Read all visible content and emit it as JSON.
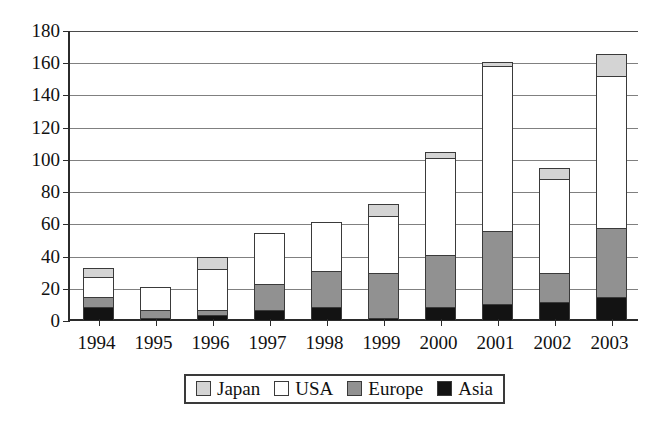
{
  "chart_data": {
    "type": "bar",
    "stacked": true,
    "title": "",
    "subtitle": "",
    "xlabel": "",
    "ylabel": "",
    "categories": [
      "1994",
      "1995",
      "1996",
      "1997",
      "1998",
      "1999",
      "2000",
      "2001",
      "2002",
      "2003"
    ],
    "series": [
      {
        "name": "Asia",
        "color": "#131313",
        "values": [
          8,
          1,
          3,
          6,
          8,
          1,
          8,
          10,
          11,
          14
        ]
      },
      {
        "name": "Europe",
        "color": "#919191",
        "values": [
          7,
          6,
          4,
          17,
          23,
          29,
          33,
          46,
          19,
          44
        ]
      },
      {
        "name": "USA",
        "color": "#ffffff",
        "values": [
          13,
          15,
          26,
          32,
          31,
          36,
          61,
          103,
          59,
          95
        ]
      },
      {
        "name": "Japan",
        "color": "#d4d4d4",
        "values": [
          6,
          0,
          8,
          0,
          0,
          8,
          4,
          3,
          7,
          14
        ]
      }
    ],
    "totals": [
      34,
      22,
      41,
      55,
      62,
      74,
      106,
      162,
      96,
      167
    ],
    "ylim": [
      0,
      180
    ],
    "yticks": [
      0,
      20,
      40,
      60,
      80,
      100,
      120,
      140,
      160,
      180
    ],
    "ytick_labels": [
      "0",
      "20",
      "40",
      "60",
      "80",
      "100",
      "120",
      "140",
      "160",
      "180"
    ],
    "grid": true,
    "legend_position": "bottom"
  },
  "legend": {
    "items": [
      {
        "label": "Japan",
        "swatch": "legend-swatch-japan",
        "color": "#d4d4d4"
      },
      {
        "label": "USA",
        "swatch": "legend-swatch-usa",
        "color": "#ffffff"
      },
      {
        "label": "Europe",
        "swatch": "legend-swatch-europe",
        "color": "#919191"
      },
      {
        "label": "Asia",
        "swatch": "legend-swatch-asia",
        "color": "#131313"
      }
    ]
  }
}
